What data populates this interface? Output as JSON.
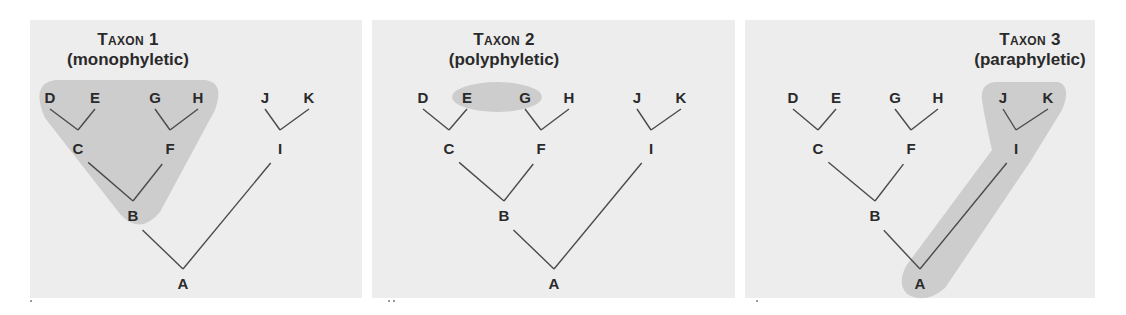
{
  "panels": [
    {
      "id": "taxon1",
      "title": "Taxon 1",
      "subtitle": "(monophyletic)",
      "title_center_x": 128,
      "x": 30,
      "width": 332,
      "nodes": {
        "D": [
          50,
          97
        ],
        "E": [
          95,
          97
        ],
        "G": [
          155,
          97
        ],
        "H": [
          198,
          97
        ],
        "J": [
          265,
          97
        ],
        "K": [
          309,
          97
        ],
        "C": [
          78,
          148
        ],
        "F": [
          170,
          148
        ],
        "I": [
          280,
          148
        ],
        "B": [
          133,
          215
        ],
        "A": [
          183,
          283
        ]
      },
      "shade": {
        "type": "path",
        "d": "M 55 80 L 205 80 Q 225 82 215 110 L 160 212 Q 140 236 120 214 L 45 118 Q 30 84 55 80 Z"
      }
    },
    {
      "id": "taxon2",
      "title": "Taxon 2",
      "subtitle": "(polyphyletic)",
      "title_center_x": 504,
      "x": 372,
      "width": 363,
      "nodes": {
        "D": [
          423,
          97
        ],
        "E": [
          467,
          97
        ],
        "G": [
          525,
          97
        ],
        "H": [
          569,
          97
        ],
        "J": [
          637,
          97
        ],
        "K": [
          681,
          97
        ],
        "C": [
          449,
          148
        ],
        "F": [
          541,
          148
        ],
        "I": [
          651,
          148
        ],
        "B": [
          504,
          215
        ],
        "A": [
          554,
          283
        ]
      },
      "shade": {
        "type": "ellipse",
        "cx": 497,
        "cy": 97,
        "rx": 45,
        "ry": 15
      }
    },
    {
      "id": "taxon3",
      "title": "Taxon 3",
      "subtitle": "(paraphyletic)",
      "title_center_x": 1030,
      "x": 745,
      "width": 350,
      "nodes": {
        "D": [
          793,
          97
        ],
        "E": [
          836,
          97
        ],
        "G": [
          895,
          97
        ],
        "H": [
          938,
          97
        ],
        "J": [
          1003,
          97
        ],
        "K": [
          1048,
          97
        ],
        "C": [
          818,
          148
        ],
        "F": [
          911,
          148
        ],
        "I": [
          1016,
          148
        ],
        "B": [
          875,
          215
        ],
        "A": [
          920,
          283
        ]
      },
      "shade": {
        "type": "path",
        "d": "M 995 82 L 1058 82 Q 1072 86 1062 110 L 1030 162 L 945 288 Q 925 305 907 294 Q 897 284 906 266 L 992 150 Q 985 120 982 100 Q 980 84 995 82 Z"
      }
    }
  ],
  "edges": [
    [
      "D",
      "C",
      "down"
    ],
    [
      "E",
      "C",
      "down"
    ],
    [
      "G",
      "F",
      "down"
    ],
    [
      "H",
      "F",
      "down"
    ],
    [
      "J",
      "I",
      "down"
    ],
    [
      "K",
      "I",
      "down"
    ],
    [
      "C",
      "B",
      "mid"
    ],
    [
      "F",
      "B",
      "mid"
    ],
    [
      "B",
      "A",
      "mid"
    ],
    [
      "I",
      "A",
      "mid"
    ]
  ],
  "colors": {
    "panel_bg": "#ededed",
    "shade": "#cdcdcd",
    "line": "#4a4a4a",
    "text": "#2a2a2a"
  }
}
